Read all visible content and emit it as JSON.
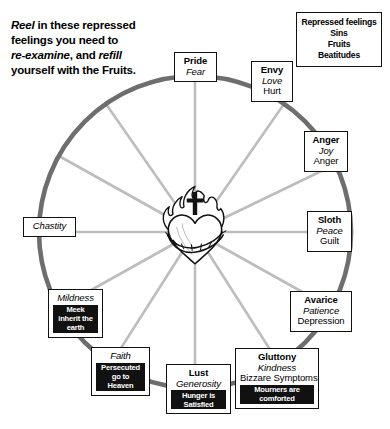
{
  "intro": {
    "line1_em": "Reel",
    "line1_rest": " in these repressed",
    "line2": "feelings you need to",
    "line3_em": "re-examine",
    "line3_rest": ", and ",
    "line3_em2": "refill",
    "line4": "yourself with the Fruits."
  },
  "legend": {
    "name": "legend-key",
    "rows": [
      "Repressed feelings",
      "Sins",
      "Fruits",
      "Beatitudes"
    ]
  },
  "center": {
    "name": "sacred-heart-emblem",
    "description": "Flaming Sacred Heart with cross and crown of thorns"
  },
  "wheel": {
    "rim_color": "#6e6e6e",
    "spoke_color": "#bdbdbd",
    "center_x": 195,
    "center_y": 232,
    "radius": 156
  },
  "nodes": [
    {
      "id": "pride",
      "sin": "Pride",
      "fruit": "Fear",
      "repressed": "",
      "beatitude": ""
    },
    {
      "id": "envy",
      "sin": "Envy",
      "fruit": "Love",
      "repressed": "Hurt",
      "beatitude": ""
    },
    {
      "id": "anger",
      "sin": "Anger",
      "fruit": "Joy",
      "repressed": "Anger",
      "beatitude": ""
    },
    {
      "id": "sloth",
      "sin": "Sloth",
      "fruit": "Peace",
      "repressed": "Guilt",
      "beatitude": ""
    },
    {
      "id": "avarice",
      "sin": "Avarice",
      "fruit": "Patience",
      "repressed": "Depression",
      "beatitude": ""
    },
    {
      "id": "gluttony",
      "sin": "Gluttony",
      "fruit": "Kindness",
      "repressed": "Bizzare Symptoms",
      "beatitude": "Mourners are comforted"
    },
    {
      "id": "lust",
      "sin": "Lust",
      "fruit": "Generosity",
      "repressed": "",
      "beatitude": "Hunger is Satisfied"
    },
    {
      "id": "faith",
      "sin": "",
      "fruit": "Faith",
      "repressed": "",
      "beatitude": "Persecuted go to Heaven"
    },
    {
      "id": "mildness",
      "sin": "",
      "fruit": "Mildness",
      "repressed": "",
      "beatitude": "Meek inherit the earth"
    },
    {
      "id": "chastity",
      "sin": "",
      "fruit": "Chastity",
      "repressed": "",
      "beatitude": ""
    }
  ]
}
